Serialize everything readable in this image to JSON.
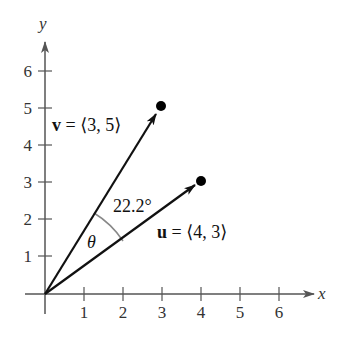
{
  "diagram": {
    "axes": {
      "x_label": "x",
      "y_label": "y",
      "x_ticks": [
        "1",
        "2",
        "3",
        "4",
        "5",
        "6"
      ],
      "y_ticks": [
        "1",
        "2",
        "3",
        "4",
        "5",
        "6"
      ]
    },
    "vectors": [
      {
        "name": "v",
        "components": [
          3,
          5
        ],
        "label_bold": "v",
        "label_rest": " = ⟨3, 5⟩"
      },
      {
        "name": "u",
        "components": [
          4,
          3
        ],
        "label_bold": "u",
        "label_rest": " = ⟨4, 3⟩"
      }
    ],
    "angle": {
      "symbol": "θ",
      "value_label": "22.2°"
    },
    "colors": {
      "axis": "#555555",
      "vector": "#111111",
      "arc": "#888888"
    }
  }
}
